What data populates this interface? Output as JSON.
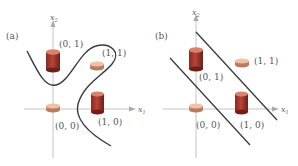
{
  "panels": [
    {
      "id": "a",
      "label": "(a)",
      "x_axis_label": "x",
      "x_axis_sub": "1",
      "y_axis_label": "x",
      "y_axis_sub": "2",
      "points": [
        {
          "label": "(0, 1)",
          "shape": "tall-cylinder",
          "color": "#c0392b"
        },
        {
          "label": "(1, 1)",
          "shape": "flat-disk",
          "color": "#e8a68a"
        },
        {
          "label": "(0, 0)",
          "shape": "flat-disk",
          "color": "#e8a68a"
        },
        {
          "label": "(1, 0)",
          "shape": "tall-cylinder",
          "color": "#c0392b"
        }
      ],
      "boundary": "nonlinear curve"
    },
    {
      "id": "b",
      "label": "(b)",
      "x_axis_label": "x",
      "x_axis_sub": "1",
      "y_axis_label": "x",
      "y_axis_sub": "2",
      "points": [
        {
          "label": "(0, 1)",
          "shape": "tall-cylinder",
          "color": "#c0392b"
        },
        {
          "label": "(1, 1)",
          "shape": "flat-disk",
          "color": "#e8a68a"
        },
        {
          "label": "(0, 0)",
          "shape": "flat-disk",
          "color": "#e8a68a"
        },
        {
          "label": "(1, 0)",
          "shape": "tall-cylinder",
          "color": "#c0392b"
        }
      ],
      "boundary": "two parallel lines"
    }
  ],
  "colors": {
    "axis": "#b8b8b8",
    "curve": "#3a3a3a",
    "tall_top": "#d9826c",
    "tall_body": "#b03a2e",
    "tall_body_dark": "#7a2520",
    "disk_top": "#ecc3a8",
    "disk_side": "#d49a7e"
  }
}
